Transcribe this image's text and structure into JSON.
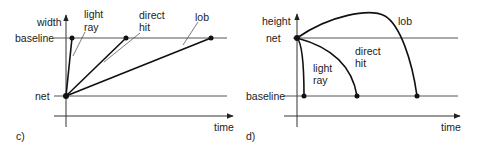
{
  "panels": [
    {
      "id": "c",
      "caption": "c)",
      "y_axis_label": "width",
      "x_axis_label": "time",
      "levels": {
        "upper": "baseline",
        "lower": "net"
      },
      "trajectories": [
        {
          "name": "light ray",
          "line1": "light",
          "line2": "ray",
          "shape": "straight steep"
        },
        {
          "name": "direct hit",
          "line1": "direct",
          "line2": "hit",
          "shape": "straight medium"
        },
        {
          "name": "lob",
          "line1": "lob",
          "shape": "straight shallow"
        }
      ]
    },
    {
      "id": "d",
      "caption": "d)",
      "y_axis_label": "height",
      "x_axis_label": "time",
      "levels": {
        "upper": "net",
        "lower": "baseline"
      },
      "trajectories": [
        {
          "name": "light ray",
          "line1": "light",
          "line2": "ray",
          "shape": "short curved drop"
        },
        {
          "name": "direct hit",
          "line1": "direct",
          "line2": "hit",
          "shape": "medium descending arc"
        },
        {
          "name": "lob",
          "line1": "lob",
          "shape": "high arc rising then falling"
        }
      ]
    }
  ],
  "colors": {
    "line": "#111111",
    "axis": "#333333",
    "background": "#ffffff"
  }
}
